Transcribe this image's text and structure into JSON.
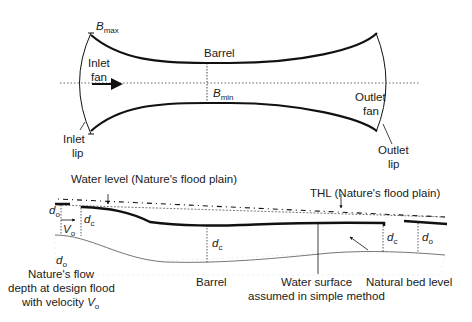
{
  "plan_view": {
    "b_max": {
      "main": "B",
      "sub": "max"
    },
    "b_min": {
      "main": "B",
      "sub": "min"
    },
    "barrel": "Barrel",
    "inlet_fan": [
      "Inlet",
      "fan"
    ],
    "outlet_fan": [
      "Outlet",
      "fan"
    ],
    "inlet_lip": [
      "Inlet",
      "lip"
    ],
    "outlet_lip": [
      "Outlet",
      "lip"
    ]
  },
  "profile_view": {
    "water_level": "Water level (Nature's flood plain)",
    "thl": "THL (Nature's flood plain)",
    "d_o": {
      "main": "d",
      "sub": "o"
    },
    "d_c": {
      "main": "d",
      "sub": "c"
    },
    "v_o": {
      "main": "V",
      "sub": "o"
    },
    "barrel": "Barrel",
    "water_surface": [
      "Water surface",
      "assumed in simple method"
    ],
    "natural_bed": "Natural bed level",
    "nature_flow": [
      "Nature's flow",
      "depth at design flood",
      "with velocity "
    ]
  },
  "colors": {
    "line": "#111111",
    "bed": "#888888",
    "hatch": "#cccccc"
  }
}
